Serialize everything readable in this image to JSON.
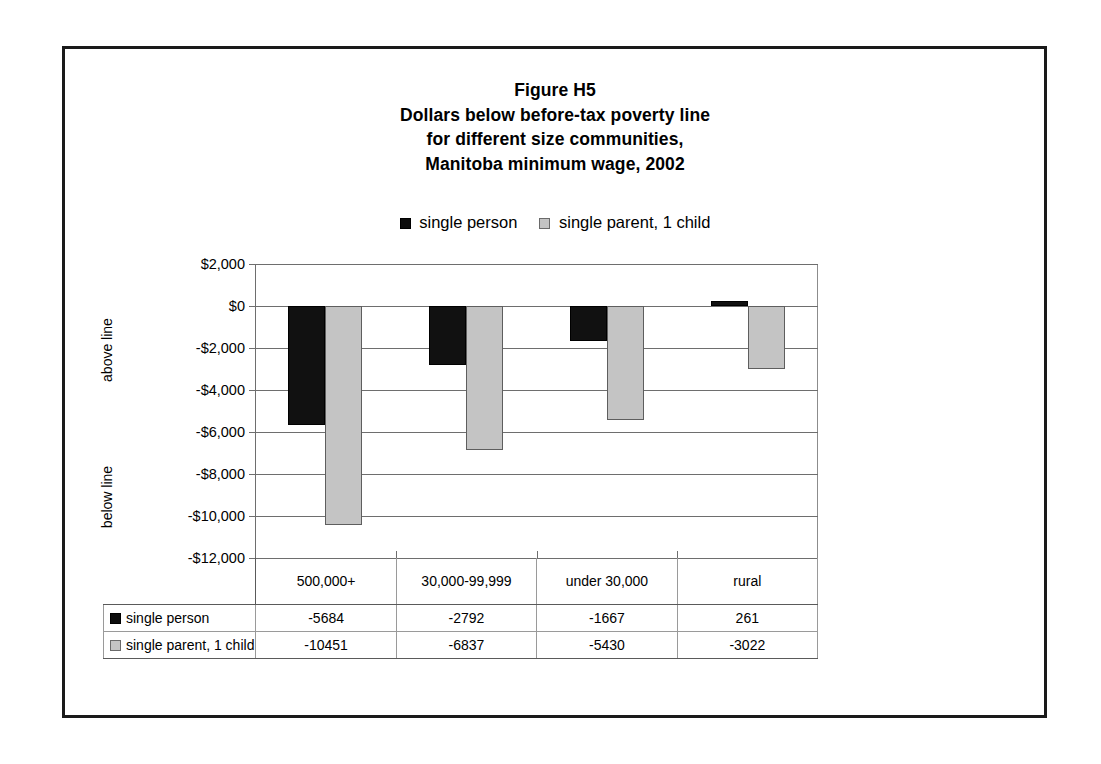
{
  "figure": {
    "title_lines": [
      "Figure H5",
      "Dollars below before-tax poverty line",
      "for different size communities,",
      "Manitoba minimum wage, 2002"
    ],
    "axis_captions": {
      "above": "above line",
      "below": "below line"
    }
  },
  "colors": {
    "single_person": "#111111",
    "single_parent": "#c4c4c4",
    "frame": "#1a1a1a",
    "gridline": "#6e6e6e"
  },
  "chart_data": {
    "type": "bar",
    "title": "Figure H5 Dollars below before-tax poverty line for different size communities, Manitoba minimum wage, 2002",
    "xlabel": "",
    "ylabel": "",
    "categories": [
      "500,000+",
      "30,000-99,999",
      "under 30,000",
      "rural"
    ],
    "series": [
      {
        "name": "single person",
        "values": [
          -5684,
          -2792,
          -1667,
          261
        ],
        "color": "#111111"
      },
      {
        "name": "single parent, 1 child",
        "values": [
          -10451,
          -6837,
          -5430,
          -3022
        ],
        "color": "#c4c4c4"
      }
    ],
    "ylim": [
      -12000,
      2000
    ],
    "ytick_values": [
      2000,
      0,
      -2000,
      -4000,
      -6000,
      -8000,
      -10000,
      -12000
    ],
    "ytick_labels": [
      "$2,000",
      "$0",
      "-$2,000",
      "-$4,000",
      "-$6,000",
      "-$8,000",
      "-$10,000",
      "-$12,000"
    ],
    "grid": true,
    "legend_position": "top",
    "legend": [
      "single person",
      "single parent, 1 child"
    ]
  },
  "table": {
    "corner": "",
    "columns": [
      "500,000+",
      "30,000-99,999",
      "under 30,000",
      "rural"
    ],
    "rows": [
      {
        "label": "single person",
        "swatch": "black-square-icon",
        "values": [
          "-5684",
          "-2792",
          "-1667",
          "261"
        ]
      },
      {
        "label": "single parent, 1 child",
        "swatch": "gray-square-icon",
        "values": [
          "-10451",
          "-6837",
          "-5430",
          "-3022"
        ]
      }
    ]
  }
}
